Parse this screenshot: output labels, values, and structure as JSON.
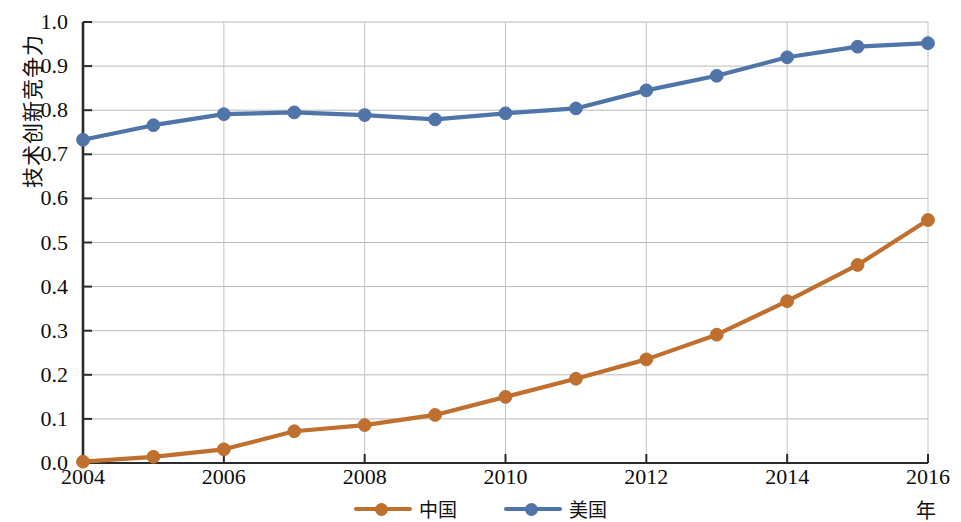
{
  "chart_data": {
    "type": "line",
    "title": "",
    "xlabel": "年",
    "ylabel": "技术创新竞争力",
    "x": [
      2004,
      2005,
      2006,
      2007,
      2008,
      2009,
      2010,
      2011,
      2012,
      2013,
      2014,
      2015,
      2016
    ],
    "xlim": [
      2004,
      2016
    ],
    "ylim": [
      0.0,
      1.0
    ],
    "grid": true,
    "legend_position": "bottom-center",
    "x_tick_labels": [
      "2004",
      "2006",
      "2008",
      "2010",
      "2012",
      "2014",
      "2016"
    ],
    "x_tick_values": [
      2004,
      2006,
      2008,
      2010,
      2012,
      2014,
      2016
    ],
    "y_tick_labels": [
      "0.0",
      "0.1",
      "0.2",
      "0.3",
      "0.4",
      "0.5",
      "0.6",
      "0.7",
      "0.8",
      "0.9",
      "1.0"
    ],
    "y_tick_values": [
      0.0,
      0.1,
      0.2,
      0.3,
      0.4,
      0.5,
      0.6,
      0.7,
      0.8,
      0.9,
      1.0
    ],
    "series": [
      {
        "name": "中国",
        "color": "#bf6f2e",
        "marker": "circle",
        "values": [
          0.003,
          0.014,
          0.031,
          0.072,
          0.086,
          0.109,
          0.15,
          0.191,
          0.235,
          0.291,
          0.367,
          0.449,
          0.551
        ]
      },
      {
        "name": "美国",
        "color": "#4f74a8",
        "marker": "circle",
        "values": [
          0.733,
          0.766,
          0.791,
          0.795,
          0.789,
          0.779,
          0.793,
          0.804,
          0.845,
          0.878,
          0.92,
          0.944,
          0.952
        ]
      }
    ]
  },
  "legend": {
    "items": [
      {
        "label": "中国",
        "color": "#bf6f2e"
      },
      {
        "label": "美国",
        "color": "#4f74a8"
      }
    ]
  },
  "axes": {
    "y_title": "技术创新竞争力",
    "x_unit": "年"
  }
}
